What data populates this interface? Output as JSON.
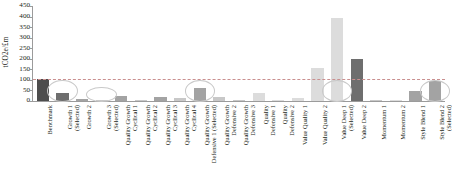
{
  "chart_data": {
    "type": "bar",
    "title": "",
    "xlabel": "",
    "ylabel": "tCO2e/£m",
    "ylim": [
      0,
      450
    ],
    "yticks": [
      0,
      50,
      100,
      150,
      200,
      250,
      300,
      350,
      400,
      450
    ],
    "grid": false,
    "legend": "none",
    "benchmark_line_value": 105,
    "categories": [
      "Benchmark",
      "Growth 1 (Selected)",
      "Growth 2",
      "Growth 3 (Selected)",
      "Quality Growth Cyclical 1",
      "Quality Growth Cyclical 2",
      "Quality Growth Cyclical 3",
      "Quality Growth Cyclical 4",
      "Quality Growth Defensive 1 (Selected)",
      "Quality Growth Defensive 2",
      "Quality Growth Defensive 3",
      "Quality Defensive 1",
      "Quality Defensive 2",
      "Value Quality 1",
      "Value Quality 2",
      "Value Deep 1 (Selected)",
      "Value Deep 2",
      "Momentum 1",
      "Momentum 2",
      "Style Blend 1",
      "Style Blend 2 (Selected)"
    ],
    "values": [
      105,
      40,
      8,
      5,
      22,
      4,
      18,
      14,
      62,
      20,
      6,
      36,
      3,
      12,
      155,
      395,
      200,
      7,
      5,
      48,
      95
    ],
    "annotations": [
      {
        "label": "highlight-growth-1",
        "category_index": 1
      },
      {
        "label": "highlight-growth-3",
        "category_index": 3
      },
      {
        "label": "highlight-quality-growth-defensive-1",
        "category_index": 8
      },
      {
        "label": "highlight-value-deep-1",
        "category_index": 15
      },
      {
        "label": "highlight-style-blend-2",
        "category_index": 20
      }
    ]
  },
  "axis": {
    "y_title": "tCO2e/£m",
    "y_tick_labels": [
      "450",
      "400",
      "350",
      "300",
      "250",
      "200",
      "150",
      "100",
      "50",
      "0"
    ]
  },
  "x_labels": [
    {
      "line1": "Benchmark",
      "line2": ""
    },
    {
      "line1": "Growth 1",
      "line2": "(Selected)"
    },
    {
      "line1": "Growth 2",
      "line2": ""
    },
    {
      "line1": "Growth 3",
      "line2": "(Selected)"
    },
    {
      "line1": "Quality Growth",
      "line2": "Cyclical 1"
    },
    {
      "line1": "Quality Growth",
      "line2": "Cyclical 2"
    },
    {
      "line1": "Quality Growth",
      "line2": "Cyclical 3"
    },
    {
      "line1": "Quality Growth",
      "line2": "Cyclical 4"
    },
    {
      "line1": "Quality Growth",
      "line2": "Defensive 1 (Selected)"
    },
    {
      "line1": "Quality Growth",
      "line2": "Defensive 2"
    },
    {
      "line1": "Quality Growth",
      "line2": "Defensive 3"
    },
    {
      "line1": "Quality",
      "line2": "Defensive 1"
    },
    {
      "line1": "Quality",
      "line2": "Defensive 2"
    },
    {
      "line1": "Value Quality 1",
      "line2": ""
    },
    {
      "line1": "Value Quality 2",
      "line2": ""
    },
    {
      "line1": "Value Deep 1",
      "line2": "(Selected)"
    },
    {
      "line1": "Value Deep 2",
      "line2": ""
    },
    {
      "line1": "Momentum 1",
      "line2": ""
    },
    {
      "line1": "Momentum 2",
      "line2": ""
    },
    {
      "line1": "Style Blend 1",
      "line2": ""
    },
    {
      "line1": "Style Blend 2",
      "line2": "(Selected)"
    }
  ],
  "colors": {
    "benchmark_bar": "#4d4d4d",
    "bar_dark": "#6e6e6e",
    "bar_mid": "#a3a3a3",
    "bar_light": "#c8c8c8",
    "bar_pale": "#dcdcdc",
    "axis": "#9b9b9b",
    "benchmark_line": "#c98f8f",
    "highlight_ring": "#c9c9c9",
    "text": "#231f20",
    "background": "#ffffff"
  },
  "bar_styles": [
    "benchmark_bar",
    "bar_dark",
    "bar_mid",
    "bar_light",
    "bar_mid",
    "bar_light",
    "bar_mid",
    "bar_light",
    "bar_mid",
    "bar_light",
    "bar_light",
    "bar_pale",
    "bar_pale",
    "bar_pale",
    "bar_pale",
    "bar_pale",
    "bar_dark",
    "bar_light",
    "bar_pale",
    "bar_mid",
    "bar_mid"
  ]
}
